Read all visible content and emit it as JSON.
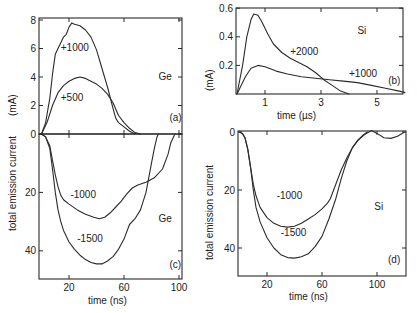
{
  "figure": {
    "y_axis_label": "total emission current",
    "y_unit_label": "(mA)"
  },
  "chart_data": [
    {
      "id": "a",
      "panel_label": "(a)",
      "type": "line",
      "material": "Ge",
      "xlabel": "time (ns)",
      "ylabel": "total emission current (mA)",
      "xlim": [
        0,
        100
      ],
      "ylim": [
        0,
        8.2
      ],
      "xticks": [
        20,
        60,
        100
      ],
      "yticks": [
        0,
        2,
        4,
        6,
        8
      ],
      "grid": false,
      "series": [
        {
          "name": "+1000",
          "x": [
            0,
            3,
            6,
            8,
            10,
            12,
            14,
            16,
            18,
            20,
            22,
            24,
            28,
            32,
            36,
            40,
            44,
            48,
            52,
            54,
            56,
            60,
            64,
            68
          ],
          "y": [
            0,
            0.8,
            2.5,
            4.2,
            5.6,
            6.0,
            6.4,
            6.8,
            7.0,
            7.5,
            7.8,
            7.7,
            7.6,
            7.3,
            6.8,
            5.9,
            4.6,
            3.3,
            1.8,
            1.1,
            0.8,
            0.5,
            0.2,
            0
          ]
        },
        {
          "name": "+500",
          "x": [
            0,
            4,
            8,
            12,
            16,
            20,
            24,
            28,
            32,
            36,
            40,
            44,
            48,
            52,
            56,
            60,
            64,
            68,
            72
          ],
          "y": [
            0,
            0.8,
            2.0,
            2.9,
            3.4,
            3.7,
            3.9,
            4.0,
            3.9,
            3.7,
            3.5,
            3.2,
            2.8,
            2.2,
            1.3,
            0.8,
            0.4,
            0.1,
            0
          ]
        }
      ],
      "annotations": [
        {
          "text": "+1000",
          "x": 14,
          "y": 5.8
        },
        {
          "text": "+500",
          "x": 14,
          "y": 2.3
        },
        {
          "text": "Ge",
          "x": 85,
          "y": 3.8
        },
        {
          "text": "(a)",
          "x": 93,
          "y": 0.9
        }
      ]
    },
    {
      "id": "b",
      "panel_label": "(b)",
      "type": "line",
      "material": "Si",
      "xlabel": "time (µs)",
      "ylabel": "(mA)",
      "xlim": [
        0,
        6
      ],
      "ylim": [
        0,
        0.6
      ],
      "xticks": [
        1,
        3,
        5
      ],
      "yticks": [
        0.2,
        0.4,
        0.6
      ],
      "grid": false,
      "series": [
        {
          "name": "+2000",
          "x": [
            0,
            0.2,
            0.35,
            0.5,
            0.6,
            0.75,
            0.9,
            1.1,
            1.3,
            1.6,
            1.9,
            2.2,
            2.5,
            2.8,
            3.1,
            3.4,
            3.7,
            4.0
          ],
          "y": [
            0,
            0.2,
            0.4,
            0.52,
            0.56,
            0.55,
            0.5,
            0.42,
            0.35,
            0.29,
            0.25,
            0.22,
            0.19,
            0.15,
            0.1,
            0.06,
            0.02,
            0
          ]
        },
        {
          "name": "+1000",
          "x": [
            0,
            0.3,
            0.5,
            0.75,
            1.0,
            1.4,
            1.8,
            2.3,
            2.8,
            3.3,
            3.8,
            4.3,
            4.8,
            5.3,
            5.8,
            6.0
          ],
          "y": [
            0,
            0.12,
            0.18,
            0.2,
            0.19,
            0.16,
            0.14,
            0.12,
            0.11,
            0.1,
            0.09,
            0.08,
            0.06,
            0.04,
            0.02,
            0.01
          ]
        }
      ],
      "annotations": [
        {
          "text": "+2000",
          "x": 1.9,
          "y": 0.27
        },
        {
          "text": "+1000",
          "x": 4.0,
          "y": 0.12
        },
        {
          "text": "Si",
          "x": 4.3,
          "y": 0.42
        },
        {
          "text": "(b)",
          "x": 5.4,
          "y": 0.07
        }
      ]
    },
    {
      "id": "c",
      "panel_label": "(c)",
      "type": "line",
      "material": "Ge",
      "xlabel": "time (ns)",
      "ylabel": "total emission current (mA, negative)",
      "xlim": [
        0,
        103
      ],
      "ylim": [
        0,
        50
      ],
      "y_inverted": true,
      "xticks": [
        20,
        60,
        100
      ],
      "yticks": [
        0,
        20,
        40
      ],
      "grid": false,
      "series": [
        {
          "name": "-1000",
          "x": [
            0,
            3,
            6,
            8,
            10,
            12,
            14,
            16,
            20,
            26,
            32,
            38,
            42,
            46,
            50,
            54,
            58,
            62,
            66,
            70,
            76,
            82,
            88,
            92,
            94,
            96,
            97
          ],
          "y": [
            0,
            1,
            4,
            9,
            14,
            18,
            21,
            22.5,
            24,
            26,
            27.5,
            28.5,
            29,
            28.5,
            27,
            25,
            23,
            20.5,
            18.5,
            17.5,
            16.5,
            15,
            12,
            7,
            3,
            1,
            0
          ]
        },
        {
          "name": "-1500",
          "x": [
            0,
            3,
            6,
            8,
            10,
            12,
            14,
            16,
            18,
            20,
            24,
            28,
            32,
            36,
            40,
            44,
            48,
            52,
            56,
            60,
            64,
            68,
            72,
            76,
            80,
            82,
            84,
            85
          ],
          "y": [
            0,
            1,
            5,
            12,
            20,
            26,
            30,
            33,
            35,
            37,
            39.5,
            41.5,
            43,
            44,
            44.5,
            44.5,
            43.5,
            42,
            39.5,
            36,
            31,
            29,
            26,
            20,
            10,
            5,
            1,
            0
          ]
        }
      ],
      "annotations": [
        {
          "text": "-1000",
          "x": 21,
          "y": 22
        },
        {
          "text": "-1500",
          "x": 26,
          "y": 37
        },
        {
          "text": "Ge",
          "x": 85,
          "y": 30
        },
        {
          "text": "(c)",
          "x": 93,
          "y": 46
        }
      ]
    },
    {
      "id": "d",
      "panel_label": "(d)",
      "type": "line",
      "material": "Si",
      "xlabel": "time (ns)",
      "ylabel": "total emission current (mA, negative)",
      "xlim": [
        0,
        120
      ],
      "ylim": [
        0,
        50
      ],
      "y_inverted": true,
      "xticks": [
        20,
        60,
        100
      ],
      "yticks": [
        0,
        20,
        40
      ],
      "grid": false,
      "series": [
        {
          "name": "-1000",
          "x": [
            0,
            2,
            4,
            6,
            8,
            10,
            12,
            15,
            20,
            25,
            30,
            35,
            40,
            45,
            50,
            55,
            60,
            64,
            66,
            70,
            74,
            78,
            82,
            86,
            90,
            93,
            96,
            100,
            105,
            110,
            115,
            120
          ],
          "y": [
            0,
            0.5,
            2,
            6,
            12,
            18,
            22,
            26,
            29.5,
            31.5,
            32.5,
            32.8,
            32.5,
            31.5,
            30,
            28.5,
            26.5,
            24.5,
            23,
            18,
            13,
            9,
            5.5,
            3,
            1.2,
            0.3,
            -0.5,
            0.5,
            2,
            2.2,
            1.5,
            0
          ]
        },
        {
          "name": "-1500",
          "x": [
            0,
            2,
            4,
            6,
            8,
            10,
            12,
            15,
            20,
            25,
            30,
            35,
            40,
            45,
            50,
            55,
            60,
            65,
            70,
            74,
            78,
            82,
            86,
            90,
            93
          ],
          "y": [
            0,
            0.5,
            2,
            6,
            12,
            20,
            26,
            31,
            36.5,
            40,
            42.3,
            43.3,
            43.5,
            43,
            42,
            39.5,
            36,
            30,
            23,
            16,
            10,
            5.5,
            2.8,
            1,
            0
          ]
        }
      ],
      "annotations": [
        {
          "text": "-1000",
          "x": 27,
          "y": 23
        },
        {
          "text": "-1500",
          "x": 30,
          "y": 36
        },
        {
          "text": "Si",
          "x": 98,
          "y": 27
        },
        {
          "text": "(d)",
          "x": 108,
          "y": 45
        }
      ]
    }
  ]
}
